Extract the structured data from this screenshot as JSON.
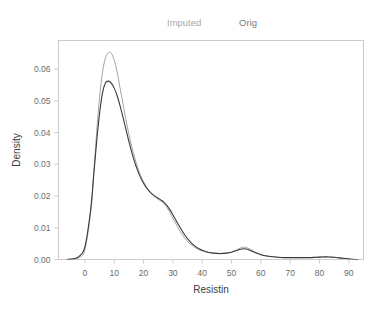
{
  "legend": {
    "imputed_label": "Imputed",
    "orig_label": "Orig",
    "imputed_color": "#a6a6a6",
    "orig_color": "#7a7a7a"
  },
  "axis_titles": {
    "x": "Resistin",
    "y": "Density"
  },
  "ticks": {
    "x_labels": [
      "0",
      "10",
      "20",
      "30",
      "40",
      "50",
      "60",
      "70",
      "80",
      "90"
    ],
    "y_labels": [
      "0.00",
      "0.01",
      "0.02",
      "0.03",
      "0.04",
      "0.05",
      "0.06"
    ]
  },
  "chart_data": {
    "type": "line",
    "title": "",
    "subtitle": "",
    "xlabel": "Resistin",
    "ylabel": "Density",
    "xlim": [
      -9,
      95
    ],
    "ylim": [
      0.0,
      0.069
    ],
    "xticks": [
      0,
      10,
      20,
      30,
      40,
      50,
      60,
      70,
      80,
      90
    ],
    "yticks": [
      0.0,
      0.01,
      0.02,
      0.03,
      0.04,
      0.05,
      0.06
    ],
    "grid": false,
    "legend_position": "top",
    "series": [
      {
        "name": "Imputed",
        "color": "#9a9a9a",
        "linewidth": 0.9,
        "x": [
          -6,
          -4,
          -2,
          0,
          2,
          3,
          4,
          5,
          6,
          7,
          8,
          9,
          10,
          11,
          12,
          13,
          14,
          15,
          16,
          17,
          18,
          19,
          20,
          21,
          22,
          23,
          24,
          25,
          26,
          27,
          28,
          29,
          30,
          32,
          34,
          36,
          38,
          40,
          42,
          44,
          46,
          48,
          50,
          52,
          53,
          54,
          55,
          56,
          58,
          60,
          62,
          65,
          68,
          70,
          73,
          76,
          79,
          81,
          83,
          85,
          87,
          89,
          91,
          93
        ],
        "y": [
          0.0,
          0.0001,
          0.0006,
          0.003,
          0.015,
          0.027,
          0.04,
          0.051,
          0.059,
          0.0635,
          0.0652,
          0.065,
          0.0628,
          0.059,
          0.054,
          0.049,
          0.044,
          0.0395,
          0.0355,
          0.032,
          0.029,
          0.0265,
          0.0245,
          0.0228,
          0.0215,
          0.0204,
          0.0196,
          0.019,
          0.0184,
          0.0176,
          0.0164,
          0.0148,
          0.013,
          0.0096,
          0.0068,
          0.0048,
          0.0035,
          0.0027,
          0.0022,
          0.0019,
          0.0018,
          0.0019,
          0.0023,
          0.0031,
          0.0036,
          0.0039,
          0.0038,
          0.0034,
          0.0024,
          0.0016,
          0.0011,
          0.0008,
          0.0006,
          0.0006,
          0.0006,
          0.0006,
          0.0007,
          0.0008,
          0.0008,
          0.0007,
          0.0005,
          0.0003,
          0.0001,
          0.0
        ]
      },
      {
        "name": "Orig",
        "color": "#3a3a3a",
        "linewidth": 1.1,
        "x": [
          -6,
          -4,
          -2,
          0,
          2,
          3,
          4,
          5,
          6,
          7,
          8,
          9,
          10,
          11,
          12,
          13,
          14,
          15,
          16,
          17,
          18,
          19,
          20,
          21,
          22,
          23,
          24,
          25,
          26,
          27,
          28,
          29,
          30,
          32,
          34,
          36,
          38,
          40,
          42,
          44,
          46,
          48,
          50,
          52,
          53,
          54,
          55,
          56,
          58,
          60,
          62,
          65,
          68,
          70,
          73,
          76,
          79,
          81,
          83,
          85,
          87,
          89,
          91,
          93
        ],
        "y": [
          0.0,
          0.0002,
          0.001,
          0.004,
          0.016,
          0.0265,
          0.037,
          0.046,
          0.0525,
          0.0556,
          0.0562,
          0.0556,
          0.054,
          0.0516,
          0.0484,
          0.0448,
          0.041,
          0.0372,
          0.0337,
          0.0306,
          0.028,
          0.0258,
          0.024,
          0.0226,
          0.0215,
          0.0206,
          0.0199,
          0.0193,
          0.0187,
          0.018,
          0.017,
          0.0157,
          0.0141,
          0.0108,
          0.0078,
          0.0055,
          0.0039,
          0.0029,
          0.0023,
          0.002,
          0.0019,
          0.002,
          0.0023,
          0.0029,
          0.0032,
          0.0034,
          0.0033,
          0.003,
          0.0022,
          0.0015,
          0.0011,
          0.0008,
          0.0006,
          0.0006,
          0.0006,
          0.0006,
          0.0007,
          0.0008,
          0.0008,
          0.0007,
          0.0005,
          0.0003,
          0.0001,
          0.0
        ]
      }
    ]
  }
}
